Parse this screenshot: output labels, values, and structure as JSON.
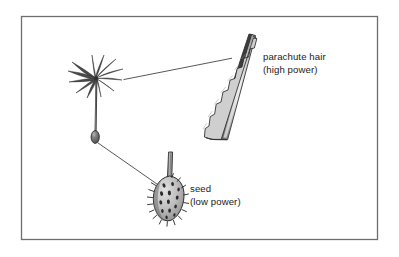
{
  "figure": {
    "name": "dandelion-seed-parachute-diagram",
    "background_color": "#ffffff",
    "frame": {
      "name": "figure-border",
      "color": "#6e6e6e",
      "x": 21,
      "y": 16,
      "width": 357,
      "height": 224
    },
    "labels": {
      "parachute_hair": {
        "line1": "parachute hair",
        "line2": "(high power)"
      },
      "seed": {
        "line1": "seed",
        "line2": "(low power)"
      }
    },
    "parts": {
      "whole_seed": "pappus-parachute-whole",
      "magnified_hair": "parachute-hair-magnified",
      "magnified_seed": "seed-magnified"
    },
    "colors": {
      "outline": "#2b2b2b",
      "fill_light": "#d8d8d8",
      "fill_mid": "#a8a8a8",
      "fill_dark": "#6a6a6a",
      "leader_line": "#3a3a3a",
      "text": "#1a1a1a"
    }
  }
}
